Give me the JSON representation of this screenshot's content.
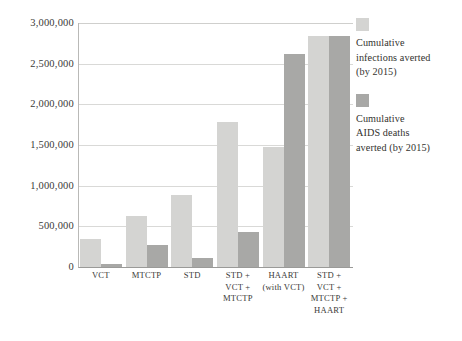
{
  "chart_data": {
    "type": "bar",
    "title": "",
    "xlabel": "",
    "ylabel": "",
    "ylim": [
      0,
      3000000
    ],
    "grid": true,
    "legend_position": "right",
    "categories": [
      "VCT",
      "MTCTP",
      "STD",
      "STD +\nVCT +\nMTCTP",
      "HAART\n(with VCT)",
      "STD +\nVCT +\nMTCTP +\nHAART"
    ],
    "category_lines": [
      [
        "VCT"
      ],
      [
        "MTCTP"
      ],
      [
        "STD"
      ],
      [
        "STD +",
        "VCT +",
        "MTCTP"
      ],
      [
        "HAART",
        "(with VCT)"
      ],
      [
        "STD +",
        "VCT +",
        "MTCTP +",
        "HAART"
      ]
    ],
    "yticks": [
      0,
      500000,
      1000000,
      1500000,
      2000000,
      2500000,
      3000000
    ],
    "ytick_labels": [
      "0",
      "500,000",
      "1,000,000",
      "1,500,000",
      "2,000,000",
      "2,500,000",
      "3,000,000"
    ],
    "series": [
      {
        "name": "Cumulative infections averted (by 2015)",
        "color": "#d4d4d2",
        "values": [
          345000,
          630000,
          880000,
          1780000,
          1470000,
          2840000
        ]
      },
      {
        "name": "Cumulative AIDS deaths averted (by 2015)",
        "color": "#a8a8a6",
        "values": [
          40000,
          265000,
          115000,
          430000,
          2620000,
          2840000
        ]
      }
    ]
  },
  "legend": {
    "items": [
      {
        "lines": [
          "Cumulative",
          "infections averted",
          "(by 2015)"
        ],
        "color": "#d4d4d2"
      },
      {
        "lines": [
          "Cumulative",
          "AIDS deaths",
          "averted (by 2015)"
        ],
        "color": "#a8a8a6"
      }
    ]
  }
}
